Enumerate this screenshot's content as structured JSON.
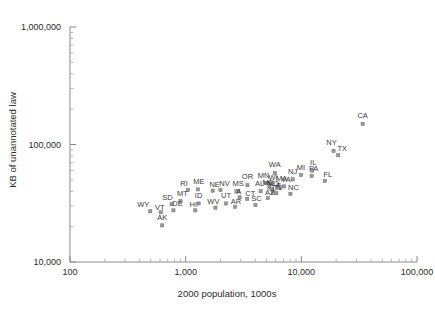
{
  "chart_data": {
    "type": "scatter",
    "title": "",
    "xlabel": "2000 population, 1000s",
    "ylabel": "KB of unannotated law",
    "xscale": "log",
    "yscale": "log",
    "xlim": [
      100,
      100000
    ],
    "ylim": [
      10000,
      1000000
    ],
    "xticks": [
      100,
      1000,
      10000,
      100000
    ],
    "xticklabels": [
      "100",
      "1,000",
      "10,000",
      "100,000"
    ],
    "yticks": [
      10000,
      100000,
      1000000
    ],
    "yticklabels": [
      "10,000",
      "100,000",
      "1,000,000"
    ],
    "grid": false,
    "legend": null,
    "marker": "square",
    "point_label_field": "state",
    "points": [
      {
        "state": "AK",
        "x": 627,
        "y": 20500
      },
      {
        "state": "WY",
        "x": 494,
        "y": 27000
      },
      {
        "state": "VT",
        "x": 609,
        "y": 26500
      },
      {
        "state": "DE",
        "x": 784,
        "y": 27500
      },
      {
        "state": "SD",
        "x": 755,
        "y": 31000
      },
      {
        "state": "MT",
        "x": 902,
        "y": 33000
      },
      {
        "state": "HI",
        "x": 1212,
        "y": 27500
      },
      {
        "state": "ID",
        "x": 1294,
        "y": 31500
      },
      {
        "state": "RI",
        "x": 1048,
        "y": 41000
      },
      {
        "state": "ME",
        "x": 1275,
        "y": 41500
      },
      {
        "state": "NE",
        "x": 1711,
        "y": 40500
      },
      {
        "state": "NV",
        "x": 1998,
        "y": 41000
      },
      {
        "state": "WV",
        "x": 1808,
        "y": 29000
      },
      {
        "state": "UT",
        "x": 2233,
        "y": 31500
      },
      {
        "state": "AR",
        "x": 2673,
        "y": 29500
      },
      {
        "state": "MS",
        "x": 2845,
        "y": 40000
      },
      {
        "state": "IA",
        "x": 2926,
        "y": 35500
      },
      {
        "state": "CT",
        "x": 3406,
        "y": 34500
      },
      {
        "state": "SC",
        "x": 4012,
        "y": 30500
      },
      {
        "state": "OR",
        "x": 3421,
        "y": 45000
      },
      {
        "state": "AL",
        "x": 4447,
        "y": 40000
      },
      {
        "state": "AZ",
        "x": 5131,
        "y": 35000
      },
      {
        "state": "MN",
        "x": 4919,
        "y": 47000
      },
      {
        "state": "MD",
        "x": 5296,
        "y": 43000
      },
      {
        "state": "MO",
        "x": 5595,
        "y": 41500
      },
      {
        "state": "WI",
        "x": 5364,
        "y": 46500
      },
      {
        "state": "VA",
        "x": 7079,
        "y": 44000
      },
      {
        "state": "MA",
        "x": 6349,
        "y": 45500
      },
      {
        "state": "TN",
        "x": 5689,
        "y": 39500
      },
      {
        "state": "IN",
        "x": 6080,
        "y": 38500
      },
      {
        "state": "WA",
        "x": 5894,
        "y": 57000
      },
      {
        "state": "NC",
        "x": 8049,
        "y": 38000
      },
      {
        "state": "NJ",
        "x": 8414,
        "y": 50500
      },
      {
        "state": "MI",
        "x": 9938,
        "y": 55000
      },
      {
        "state": "IL",
        "x": 12419,
        "y": 60000
      },
      {
        "state": "PA",
        "x": 12281,
        "y": 54000
      },
      {
        "state": "FL",
        "x": 15982,
        "y": 49000
      },
      {
        "state": "NY",
        "x": 18976,
        "y": 88000
      },
      {
        "state": "TX",
        "x": 20852,
        "y": 81000
      },
      {
        "state": "CA",
        "x": 33872,
        "y": 150000
      }
    ]
  }
}
